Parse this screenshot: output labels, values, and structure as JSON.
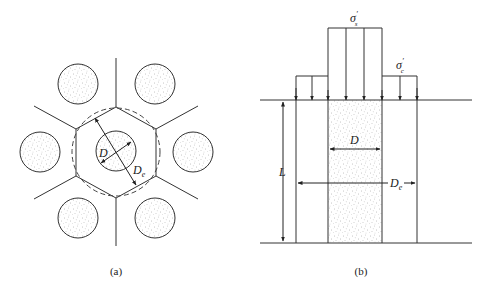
{
  "figure_a": {
    "caption": "(a)",
    "label_D": "D",
    "label_De_main": "D",
    "label_De_sub": "e",
    "description": "Hexagonal (triangular) arrangement of stone columns showing unit cell: central column of diameter D within hexagonal influence zone approximated by equivalent circle of diameter De; six neighboring columns around it."
  },
  "figure_b": {
    "caption": "(b)",
    "label_sigma_s_main": "σ",
    "label_sigma_s_sup": "′",
    "label_sigma_s_sub": "s",
    "label_sigma_c_main": "σ",
    "label_sigma_c_sup": "′",
    "label_sigma_c_sub": "c",
    "label_D": "D",
    "label_De_main": "D",
    "label_De_sub": "e",
    "label_L": "L",
    "description": "Unit cell cross-section: column of diameter D and length L within equivalent diameter De; stress σ's applied on the column and σ'c on the surrounding soil."
  },
  "colors": {
    "line": "#333333",
    "fill_dot": "#8a8a8a",
    "background": "#ffffff"
  }
}
